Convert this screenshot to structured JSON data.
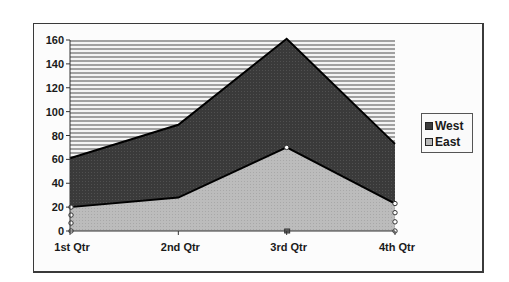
{
  "chart_data": {
    "type": "area",
    "stacked": true,
    "title": "",
    "xlabel": "",
    "ylabel": "",
    "categories": [
      "1st Qtr",
      "2nd Qtr",
      "3rd Qtr",
      "4th Qtr"
    ],
    "series": [
      {
        "name": "East",
        "values": [
          20,
          28,
          70,
          23
        ],
        "color": "#b8b8b8"
      },
      {
        "name": "West",
        "values": [
          41,
          61,
          91,
          50
        ],
        "color": "#3c3c3c"
      }
    ],
    "stack_totals": [
      61,
      89,
      161,
      73
    ],
    "ylim": [
      0,
      160
    ],
    "yticks": [
      "0",
      "20",
      "40",
      "60",
      "80",
      "100",
      "120",
      "140",
      "160"
    ],
    "grid": "horizontal hatched lines in plot background",
    "legend_position": "right",
    "legend_order": [
      "West",
      "East"
    ]
  },
  "legend": {
    "items": [
      {
        "label": "West",
        "color": "#3c3c3c"
      },
      {
        "label": "East",
        "color": "#b8b8b8"
      }
    ]
  }
}
